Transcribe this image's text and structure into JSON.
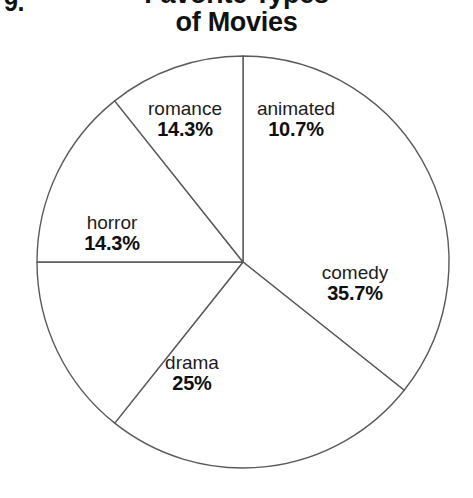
{
  "page": {
    "question_number": "9.",
    "background_color": "#ffffff"
  },
  "header": {
    "title_line_1": "Favorite Types",
    "title_line_2": "of Movies"
  },
  "chart_data": {
    "type": "pie",
    "title": "Favorite Types of Movies",
    "xlabel": "",
    "ylabel": "",
    "legend_position": "none",
    "labels_inside_slices": true,
    "start_angle_deg": 0,
    "direction": "clockwise",
    "stroke_color": "#5a5a5c",
    "slice_fill_color": "#ffffff",
    "categories": [
      "comedy",
      "drama",
      "horror",
      "romance",
      "animated"
    ],
    "values": [
      35.7,
      25.0,
      14.3,
      14.3,
      10.7
    ],
    "slices": [
      {
        "label": "comedy",
        "percent_text": "35.7%",
        "value": 35.7,
        "label_x": 355,
        "label_y": 283
      },
      {
        "label": "drama",
        "percent_text": "25%",
        "value": 25.0,
        "label_x": 192,
        "label_y": 373
      },
      {
        "label": "horror",
        "percent_text": "14.3%",
        "value": 14.3,
        "label_x": 112,
        "label_y": 233
      },
      {
        "label": "romance",
        "percent_text": "14.3%",
        "value": 14.3,
        "label_x": 185,
        "label_y": 119
      },
      {
        "label": "animated",
        "percent_text": "10.7%",
        "value": 10.7,
        "label_x": 296,
        "label_y": 119
      }
    ],
    "geometry": {
      "center_x": 243,
      "center_y": 262,
      "radius": 206
    }
  }
}
